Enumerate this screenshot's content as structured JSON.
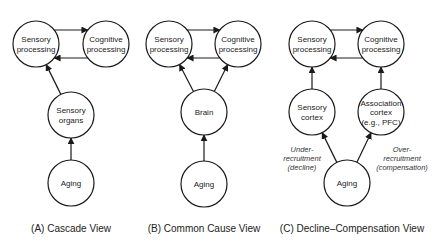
{
  "panels": [
    {
      "caption": "(A) Cascade View",
      "nodes": [
        {
          "id": "sp",
          "lines": [
            "Sensory",
            "processing"
          ],
          "cx": 36,
          "cy": 44
        },
        {
          "id": "cp",
          "lines": [
            "Cognitive",
            "processing"
          ],
          "cx": 106,
          "cy": 44
        },
        {
          "id": "so",
          "lines": [
            "Sensory",
            "organs"
          ],
          "cx": 71,
          "cy": 115
        },
        {
          "id": "ag",
          "lines": [
            "Aging"
          ],
          "cx": 71,
          "cy": 183
        }
      ],
      "edges": [
        {
          "from": "sp",
          "to": "cp",
          "kind": "top"
        },
        {
          "from": "cp",
          "to": "sp",
          "kind": "bottom"
        },
        {
          "from": "so",
          "to": "sp"
        },
        {
          "from": "ag",
          "to": "so"
        }
      ]
    },
    {
      "caption": "(B) Common Cause View",
      "nodes": [
        {
          "id": "sp",
          "lines": [
            "Sensory",
            "processing"
          ],
          "cx": 169,
          "cy": 44
        },
        {
          "id": "cp",
          "lines": [
            "Cognitive",
            "processing"
          ],
          "cx": 238,
          "cy": 44
        },
        {
          "id": "br",
          "lines": [
            "Brain"
          ],
          "cx": 204,
          "cy": 112
        },
        {
          "id": "ag",
          "lines": [
            "Aging"
          ],
          "cx": 204,
          "cy": 184
        }
      ],
      "edges": [
        {
          "from": "sp",
          "to": "cp",
          "kind": "top"
        },
        {
          "from": "cp",
          "to": "sp",
          "kind": "bottom"
        },
        {
          "from": "br",
          "to": "sp"
        },
        {
          "from": "br",
          "to": "cp"
        },
        {
          "from": "ag",
          "to": "br"
        }
      ]
    },
    {
      "caption": "(C) Decline–Compensation View",
      "nodes": [
        {
          "id": "sp",
          "lines": [
            "Sensory",
            "processing"
          ],
          "cx": 312,
          "cy": 44
        },
        {
          "id": "cp",
          "lines": [
            "Cognitive",
            "processing"
          ],
          "cx": 381,
          "cy": 44
        },
        {
          "id": "sc",
          "lines": [
            "Sensory",
            "cortex"
          ],
          "cx": 312,
          "cy": 112
        },
        {
          "id": "ac",
          "lines": [
            "Association",
            "cortex",
            "(e.g., PFC)"
          ],
          "cx": 381,
          "cy": 112
        },
        {
          "id": "ag",
          "lines": [
            "Aging"
          ],
          "cx": 347,
          "cy": 183
        }
      ],
      "edges": [
        {
          "from": "sp",
          "to": "cp",
          "kind": "top"
        },
        {
          "from": "cp",
          "to": "sp",
          "kind": "bottom"
        },
        {
          "from": "sc",
          "to": "sp"
        },
        {
          "from": "ac",
          "to": "cp"
        },
        {
          "from": "ag",
          "to": "sc"
        },
        {
          "from": "ag",
          "to": "ac"
        }
      ],
      "annotations": [
        {
          "lines": [
            "Under-",
            "recruitment",
            "(decline)"
          ],
          "x": 302,
          "y": 152
        },
        {
          "lines": [
            "Over-",
            "recruitment",
            "(compensation)"
          ],
          "x": 402,
          "y": 152
        }
      ]
    }
  ],
  "style": {
    "node_radius": 23,
    "stroke": "#1a1a1a"
  }
}
